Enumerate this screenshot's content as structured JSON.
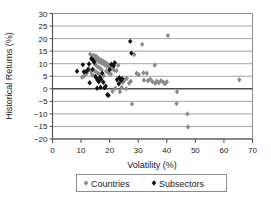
{
  "chart_data": {
    "type": "scatter",
    "title": "",
    "xlabel": "Volatility (%)",
    "ylabel": "Historical Returns (%)",
    "xlim": [
      0,
      70
    ],
    "ylim": [
      -20,
      30
    ],
    "xticks": [
      0,
      10,
      20,
      30,
      40,
      50,
      60,
      70
    ],
    "yticks": [
      30,
      25,
      20,
      15,
      10,
      5,
      0,
      -5,
      -10,
      -15,
      -20
    ],
    "grid": "horizontal",
    "legend_position": "bottom",
    "marker": "diamond",
    "series": [
      {
        "name": "Countries",
        "color": "#8a8a8a",
        "points": [
          [
            13.2,
            13.8
          ],
          [
            13.8,
            12.6
          ],
          [
            14.3,
            13.4
          ],
          [
            14.8,
            12.0
          ],
          [
            15.2,
            13.1
          ],
          [
            15.6,
            11.4
          ],
          [
            16.0,
            12.2
          ],
          [
            16.4,
            10.8
          ],
          [
            16.9,
            11.6
          ],
          [
            17.3,
            10.2
          ],
          [
            17.8,
            11.0
          ],
          [
            18.2,
            9.6
          ],
          [
            18.6,
            10.4
          ],
          [
            19.0,
            9.0
          ],
          [
            19.4,
            9.8
          ],
          [
            19.9,
            8.4
          ],
          [
            20.3,
            9.2
          ],
          [
            20.8,
            8.0
          ],
          [
            21.2,
            8.8
          ],
          [
            21.6,
            7.4
          ],
          [
            15.0,
            9.6
          ],
          [
            15.8,
            8.8
          ],
          [
            16.6,
            8.2
          ],
          [
            17.2,
            7.6
          ],
          [
            14.6,
            7.2
          ],
          [
            15.4,
            6.6
          ],
          [
            16.2,
            6.0
          ],
          [
            13.9,
            5.6
          ],
          [
            12.6,
            8.2
          ],
          [
            13.4,
            7.0
          ],
          [
            12.0,
            6.2
          ],
          [
            11.2,
            5.2
          ],
          [
            10.4,
            4.6
          ],
          [
            18.8,
            7.0
          ],
          [
            19.6,
            6.4
          ],
          [
            20.4,
            5.8
          ],
          [
            17.9,
            5.2
          ],
          [
            16.8,
            4.4
          ],
          [
            22.4,
            7.2
          ],
          [
            23.0,
            9.4
          ],
          [
            22.0,
            0.2
          ],
          [
            23.6,
            -1.2
          ],
          [
            24.6,
            2.6
          ],
          [
            25.2,
            3.4
          ],
          [
            26.0,
            4.2
          ],
          [
            26.8,
            2.2
          ],
          [
            27.4,
            3.0
          ],
          [
            27.8,
            -6.1
          ],
          [
            28.6,
            13.6
          ],
          [
            29.4,
            6.2
          ],
          [
            30.2,
            5.6
          ],
          [
            31.4,
            17.7
          ],
          [
            32.0,
            3.4
          ],
          [
            33.4,
            3.2
          ],
          [
            34.2,
            3.8
          ],
          [
            35.0,
            2.8
          ],
          [
            35.8,
            9.4
          ],
          [
            36.4,
            3.0
          ],
          [
            37.2,
            2.4
          ],
          [
            38.0,
            3.2
          ],
          [
            38.8,
            2.6
          ],
          [
            39.4,
            2.0
          ],
          [
            40.4,
            21.2
          ],
          [
            43.6,
            -1.2
          ],
          [
            43.4,
            -5.9
          ],
          [
            47.2,
            -10.0
          ],
          [
            47.4,
            -15.2
          ],
          [
            65.4,
            3.6
          ],
          [
            24.2,
            0.6
          ],
          [
            25.8,
            0.0
          ],
          [
            21.0,
            -1.0
          ],
          [
            33.0,
            6.2
          ],
          [
            31.8,
            6.4
          ],
          [
            36.0,
            2.2
          ],
          [
            40.0,
            2.8
          ]
        ]
      },
      {
        "name": "Subsectors",
        "color": "#111111",
        "points": [
          [
            8.6,
            7.0
          ],
          [
            10.6,
            9.6
          ],
          [
            11.0,
            6.8
          ],
          [
            11.8,
            6.9
          ],
          [
            12.8,
            9.9
          ],
          [
            13.0,
            2.4
          ],
          [
            14.2,
            11.4
          ],
          [
            14.6,
            10.6
          ],
          [
            15.0,
            4.9
          ],
          [
            15.4,
            4.2
          ],
          [
            15.8,
            3.4
          ],
          [
            16.2,
            2.8
          ],
          [
            16.6,
            4.6
          ],
          [
            17.0,
            3.8
          ],
          [
            17.4,
            6.2
          ],
          [
            17.8,
            2.6
          ],
          [
            18.2,
            0.4
          ],
          [
            18.6,
            1.0
          ],
          [
            19.2,
            -2.4
          ],
          [
            19.6,
            -2.6
          ],
          [
            16.8,
            0.6
          ],
          [
            15.6,
            0.2
          ],
          [
            20.0,
            7.6
          ],
          [
            20.6,
            9.8
          ],
          [
            21.4,
            9.2
          ],
          [
            21.8,
            10.4
          ],
          [
            23.4,
            4.4
          ],
          [
            24.0,
            3.2
          ],
          [
            24.4,
            4.0
          ],
          [
            27.2,
            18.9
          ],
          [
            27.6,
            14.2
          ],
          [
            13.6,
            12.0
          ],
          [
            14.0,
            7.8
          ],
          [
            12.4,
            7.6
          ],
          [
            22.6,
            3.6
          ],
          [
            23.2,
            2.0
          ]
        ]
      }
    ]
  },
  "legend": {
    "items": [
      {
        "label": "Countries",
        "color": "#8a8a8a"
      },
      {
        "label": "Subsectors",
        "color": "#111111"
      }
    ]
  }
}
